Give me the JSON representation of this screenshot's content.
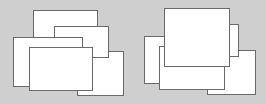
{
  "diagram": {
    "background": "#cfcfcf",
    "window_fill": "#ffffff",
    "window_border": "#6a6a6a",
    "panels": [
      {
        "name": "cascade-left",
        "windows": [
          {
            "x": 33,
            "y": 10,
            "w": 65,
            "h": 59
          },
          {
            "x": 77,
            "y": 51,
            "w": 47,
            "h": 45
          },
          {
            "x": 54,
            "y": 26,
            "w": 55,
            "h": 32
          },
          {
            "x": 13,
            "y": 37,
            "w": 70,
            "h": 50
          },
          {
            "x": 29,
            "y": 47,
            "w": 64,
            "h": 44
          }
        ]
      },
      {
        "name": "cascade-right",
        "windows": [
          {
            "x": 144,
            "y": 36,
            "w": 40,
            "h": 48
          },
          {
            "x": 207,
            "y": 50,
            "w": 49,
            "h": 45
          },
          {
            "x": 159,
            "y": 46,
            "w": 66,
            "h": 44
          },
          {
            "x": 200,
            "y": 24,
            "w": 39,
            "h": 33
          },
          {
            "x": 164,
            "y": 8,
            "w": 66,
            "h": 59
          }
        ]
      }
    ]
  }
}
